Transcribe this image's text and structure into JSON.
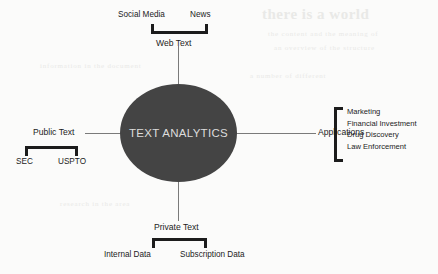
{
  "diagram": {
    "hub": {
      "label": "TEXT ANALYTICS",
      "fill_color": "#444444",
      "text_color": "#dcdcdc"
    },
    "branches": {
      "top": {
        "label": "Web Text",
        "children": [
          {
            "label": "Social Media"
          },
          {
            "label": "News"
          }
        ]
      },
      "left": {
        "label": "Public Text",
        "children": [
          {
            "label": "SEC"
          },
          {
            "label": "USPTO"
          }
        ]
      },
      "bottom": {
        "label": "Private Text",
        "children": [
          {
            "label": "Internal Data"
          },
          {
            "label": "Subscription Data"
          }
        ]
      },
      "right": {
        "label": "Applications",
        "children": [
          {
            "label": "Marketing"
          },
          {
            "label": "Financial Investment"
          },
          {
            "label": "Drug Discovery"
          },
          {
            "label": "Law Enforcement"
          }
        ]
      }
    },
    "colors": {
      "background": "#fbfbfa",
      "stroke": "#7a7a7a",
      "bracket": "#1c1c1c",
      "text": "#1c1c1c"
    }
  },
  "artifacts": {
    "ghost_heading": "there is a world",
    "ghost_lines": [
      "the content and the meaning of",
      "an overview of the structure",
      "information in the document",
      "a number of different",
      "research in the area"
    ]
  }
}
